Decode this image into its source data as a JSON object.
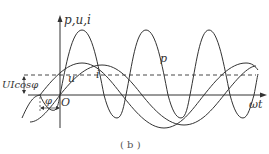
{
  "figure": {
    "caption": "( b )",
    "axis_y_label": "p,u,i",
    "axis_x_label": "ωt",
    "origin_label": "O",
    "curve_labels": {
      "p": "p",
      "u": "u",
      "i": "i"
    },
    "average_power_label": "UIcosφ",
    "phase_label": "φ"
  },
  "colors": {
    "stroke": "#333333",
    "background": "#ffffff"
  }
}
